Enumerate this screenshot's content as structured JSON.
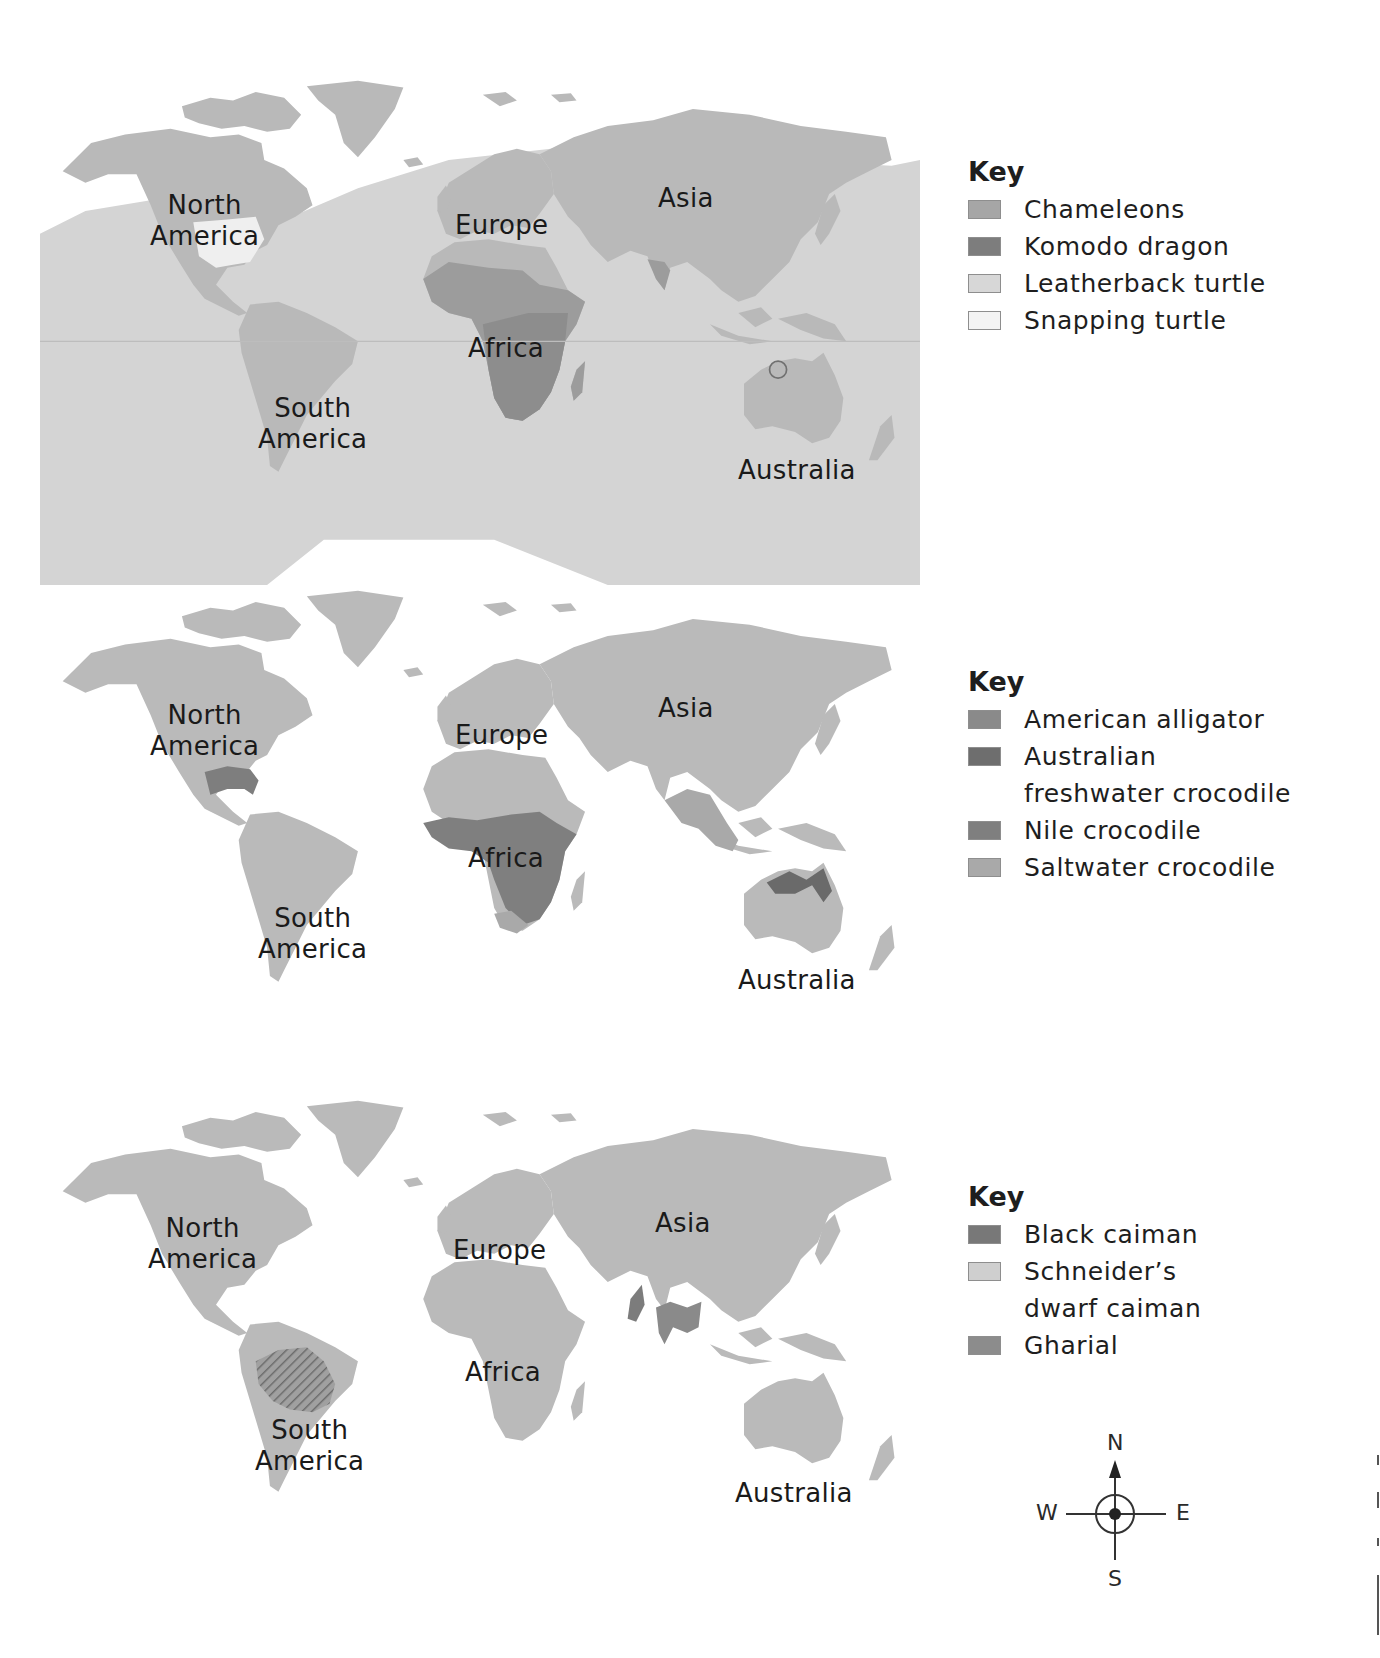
{
  "colors": {
    "land": "#b8b8b8",
    "ocean_range": "#d2d2d2",
    "chameleons": "#a6a6a6",
    "komodo_dragon": "#7d7d7d",
    "leatherback_turtle": "#d7d7d7",
    "snapping_turtle": "#f1f1f1",
    "american_alligator": "#8a8a8a",
    "australian_freshwater_crocodile": "#6e6e6e",
    "nile_crocodile": "#7f7f7f",
    "saltwater_crocodile": "#a9a9a9",
    "black_caiman": "#787878",
    "schneiders_dwarf_caiman": "#cfcfcf",
    "gharial": "#8c8c8c",
    "label_text": "#1a1a1a"
  },
  "maps": [
    {
      "id": "map-turtles-lizards",
      "continents": {
        "north_america": "North\nAmerica",
        "south_america": "South\nAmerica",
        "europe": "Europe",
        "africa": "Africa",
        "asia": "Asia",
        "australia": "Australia"
      },
      "key": {
        "title": "Key",
        "items": [
          {
            "label": "Chameleons",
            "color": "#a6a6a6"
          },
          {
            "label": "Komodo dragon",
            "color": "#7d7d7d"
          },
          {
            "label": "Leatherback turtle",
            "color": "#d7d7d7"
          },
          {
            "label": "Snapping turtle",
            "color": "#f1f1f1"
          }
        ]
      }
    },
    {
      "id": "map-crocodilians",
      "continents": {
        "north_america": "North\nAmerica",
        "south_america": "South\nAmerica",
        "europe": "Europe",
        "africa": "Africa",
        "asia": "Asia",
        "australia": "Australia"
      },
      "key": {
        "title": "Key",
        "items": [
          {
            "label": "American alligator",
            "color": "#8a8a8a"
          },
          {
            "label": "Australian\nfreshwater crocodile",
            "color": "#6e6e6e"
          },
          {
            "label": "Nile crocodile",
            "color": "#7f7f7f"
          },
          {
            "label": "Saltwater crocodile",
            "color": "#a9a9a9"
          }
        ]
      }
    },
    {
      "id": "map-caimans-gharial",
      "continents": {
        "north_america": "North\nAmerica",
        "south_america": "South\nAmerica",
        "europe": "Europe",
        "africa": "Africa",
        "asia": "Asia",
        "australia": "Australia"
      },
      "key": {
        "title": "Key",
        "items": [
          {
            "label": "Black caiman",
            "color": "#787878"
          },
          {
            "label": "Schneider’s\ndwarf caiman",
            "color": "#cfcfcf"
          },
          {
            "label": "Gharial",
            "color": "#8c8c8c"
          }
        ]
      }
    }
  ],
  "compass": {
    "north": "N",
    "south": "S",
    "east": "E",
    "west": "W"
  }
}
